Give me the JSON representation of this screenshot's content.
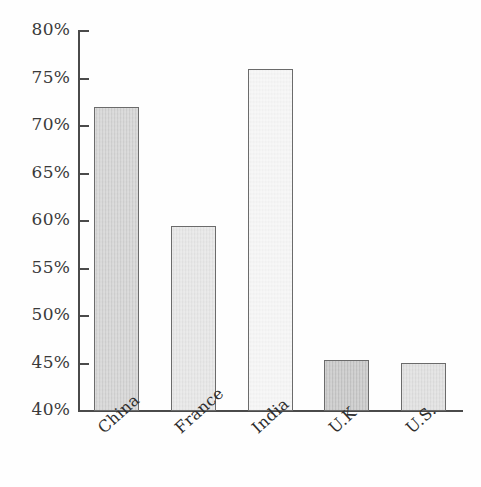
{
  "chart_data": {
    "type": "bar",
    "title": "",
    "subtitle": "",
    "xlabel": "",
    "ylabel": "",
    "categories": [
      "China",
      "France",
      "India",
      "U.K",
      "U.S."
    ],
    "values": [
      72.0,
      59.5,
      76.0,
      45.4,
      45.1
    ],
    "value_suffix": "%",
    "ylim": [
      40,
      80
    ],
    "ytick_values": [
      40,
      45,
      50,
      55,
      60,
      65,
      70,
      75,
      80
    ],
    "ytick_labels": [
      "40%",
      "45%",
      "50%",
      "55%",
      "60%",
      "65%",
      "70%",
      "75%",
      "80%"
    ],
    "grid": false,
    "legend": false,
    "legend_position": "none",
    "bar_colors": [
      "#cfcfcf",
      "#e3e3e3",
      "#f4f4f4",
      "#c2c2c2",
      "#dcdcdc"
    ],
    "bar_edge_color": "#6b6b6b",
    "axis_color": "#4a4a4a",
    "background_color": "#fefefe",
    "label_rotation": -42
  },
  "axis": {
    "y": {
      "ticks": [
        {
          "label": "80%",
          "value": 80
        },
        {
          "label": "75%",
          "value": 75
        },
        {
          "label": "70%",
          "value": 70
        },
        {
          "label": "65%",
          "value": 65
        },
        {
          "label": "60%",
          "value": 60
        },
        {
          "label": "55%",
          "value": 55
        },
        {
          "label": "50%",
          "value": 50
        },
        {
          "label": "45%",
          "value": 45
        },
        {
          "label": "40%",
          "value": 40
        }
      ]
    },
    "x": {
      "ticks": [
        {
          "label": "China"
        },
        {
          "label": "France"
        },
        {
          "label": "India"
        },
        {
          "label": "U.K"
        },
        {
          "label": "U.S."
        }
      ]
    }
  }
}
